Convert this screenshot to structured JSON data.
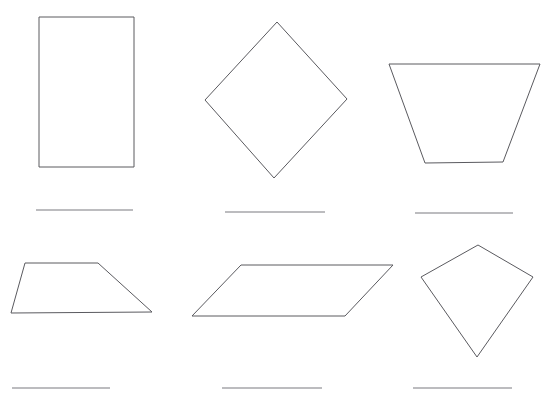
{
  "page": {
    "title": "Quadrilateral Identification Worksheet",
    "background_color": "#ffffff",
    "width": 554,
    "height": 400,
    "stroke_color": "#5a5a5f",
    "rule_color": "#7b7b80"
  },
  "figures": [
    {
      "id": "figure-1",
      "shape_name": "rectangle",
      "label": "Figure 1 rectangle",
      "points": "39,17 134,17 134,167 39,167",
      "answer_line": {
        "x1": 36,
        "y1": 210,
        "x2": 133,
        "y2": 210
      },
      "answer_value": ""
    },
    {
      "id": "figure-2",
      "shape_name": "rhombus",
      "label": "Figure 2 rhombus",
      "points": "277,22 347,99 274,178 205,100",
      "answer_line": {
        "x1": 225,
        "y1": 212,
        "x2": 325,
        "y2": 212
      },
      "answer_value": ""
    },
    {
      "id": "figure-3",
      "shape_name": "trapezoid",
      "label": "Figure 3 trapezoid",
      "points": "389,64 540,64 503,162 425,163",
      "answer_line": {
        "x1": 415,
        "y1": 213,
        "x2": 513,
        "y2": 213
      },
      "answer_value": ""
    },
    {
      "id": "figure-4",
      "shape_name": "trapezoid",
      "label": "Figure 4 trapezoid",
      "points": "25,263 98,263 152,312 11,313",
      "answer_line": {
        "x1": 12,
        "y1": 388,
        "x2": 110,
        "y2": 388
      },
      "answer_value": ""
    },
    {
      "id": "figure-5",
      "shape_name": "parallelogram",
      "label": "Figure 5 parallelogram",
      "points": "241,265 393,265 345,316 192,316",
      "answer_line": {
        "x1": 222,
        "y1": 388,
        "x2": 322,
        "y2": 388
      },
      "answer_value": ""
    },
    {
      "id": "figure-6",
      "shape_name": "kite",
      "label": "Figure 6 kite",
      "points": "478,245 533,277 477,357 421,277",
      "answer_line": {
        "x1": 413,
        "y1": 388,
        "x2": 512,
        "y2": 388
      },
      "answer_value": ""
    }
  ]
}
